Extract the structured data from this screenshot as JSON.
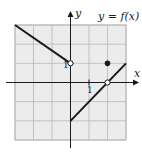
{
  "figure": {
    "title": "y = f(x)",
    "x_axis_label": "x",
    "y_axis_label": "y",
    "x_tick_label": "1",
    "y_tick_label": "1",
    "grid": {
      "xmin": -3,
      "xmax": 3,
      "ymin": -3,
      "ymax": 3
    },
    "colors": {
      "grid_bg": "#ececec",
      "grid_line": "#b8b8b8",
      "ink": "#1a1a1a"
    },
    "segments": [
      {
        "from": [
          -3,
          3
        ],
        "to": [
          0,
          1
        ],
        "end_open": true
      },
      {
        "from": [
          0,
          -2
        ],
        "to": [
          3,
          1
        ],
        "open_at": [
          2,
          0
        ]
      }
    ],
    "open_points": [
      [
        0,
        1
      ],
      [
        2,
        0
      ]
    ],
    "closed_points": [
      [
        2,
        1
      ]
    ]
  }
}
